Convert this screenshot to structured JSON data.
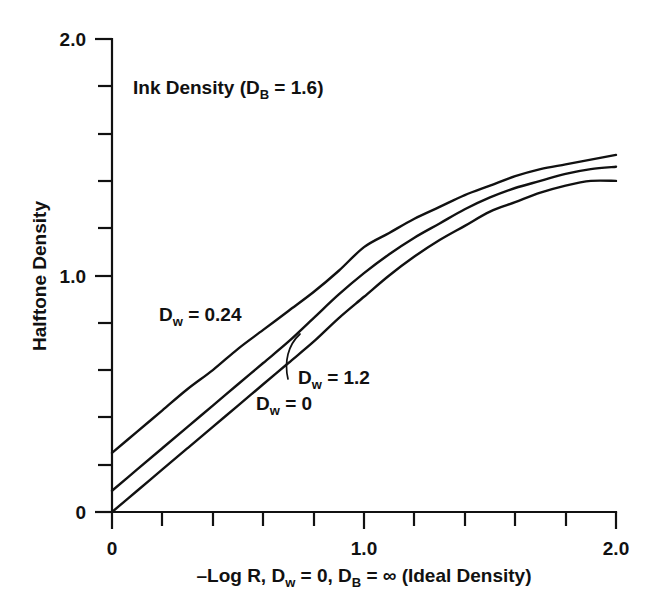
{
  "chart_data": {
    "type": "line",
    "title_parts": {
      "main": "Ink Density (D",
      "sub": "B",
      "tail": " = 1.6)"
    },
    "xlabel": "–Log R, D_w = 0, D_B = ∞ (Ideal Density)",
    "xlabel_parts": {
      "p1": "–Log R, D",
      "s1": "w",
      "p2": " = 0, D",
      "s2": "B",
      "p3": " = ∞ (Ideal Density)"
    },
    "ylabel": "Halftone Density",
    "xlim": [
      0,
      2.0
    ],
    "ylim": [
      0,
      2.0
    ],
    "grid": false,
    "legend_position": "inline-annotations",
    "x_major_ticks": [
      0,
      1.0,
      2.0
    ],
    "x_major_tick_labels": [
      "0",
      "1.0",
      "2.0"
    ],
    "x_minor_tick_step": 0.2,
    "y_major_ticks": [
      0,
      1.0,
      2.0
    ],
    "y_major_tick_labels": [
      "0",
      "1.0",
      "2.0"
    ],
    "y_minor_tick_step": 0.2,
    "x": [
      0,
      0.1,
      0.2,
      0.3,
      0.4,
      0.5,
      0.6,
      0.7,
      0.8,
      0.9,
      1.0,
      1.1,
      1.2,
      1.3,
      1.4,
      1.5,
      1.6,
      1.7,
      1.8,
      1.9,
      2.0
    ],
    "series": [
      {
        "name": "D_w = 0.24",
        "label_parts": {
          "p1": "D",
          "s1": "w",
          "p2": " = 0.24"
        },
        "color": "#111111",
        "values": [
          0.25,
          0.34,
          0.43,
          0.52,
          0.6,
          0.69,
          0.77,
          0.85,
          0.93,
          1.02,
          1.12,
          1.18,
          1.24,
          1.29,
          1.34,
          1.38,
          1.42,
          1.45,
          1.47,
          1.49,
          1.51
        ]
      },
      {
        "name": "D_w = 1.2",
        "label_parts": {
          "p1": "D",
          "s1": "w",
          "p2": " = 1.2"
        },
        "color": "#111111",
        "values": [
          0.09,
          0.18,
          0.27,
          0.36,
          0.45,
          0.54,
          0.63,
          0.72,
          0.82,
          0.92,
          1.01,
          1.09,
          1.16,
          1.22,
          1.28,
          1.33,
          1.37,
          1.4,
          1.43,
          1.45,
          1.46
        ]
      },
      {
        "name": "D_w = 0",
        "label_parts": {
          "p1": "D",
          "s1": "w",
          "p2": " = 0"
        },
        "color": "#111111",
        "values": [
          0.0,
          0.09,
          0.18,
          0.27,
          0.36,
          0.45,
          0.54,
          0.63,
          0.72,
          0.82,
          0.91,
          1.0,
          1.08,
          1.15,
          1.21,
          1.27,
          1.31,
          1.35,
          1.38,
          1.4,
          1.4
        ]
      }
    ],
    "annotations": [
      {
        "text": "Ink Density (D_B = 1.6)",
        "x": 0.18,
        "y": 1.82
      }
    ]
  }
}
